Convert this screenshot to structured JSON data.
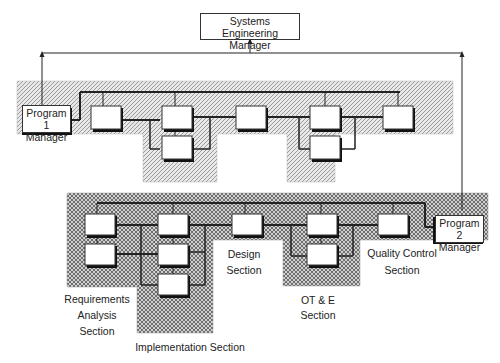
{
  "diagram": {
    "top_manager": {
      "label_line1": "Systems",
      "label_line2": "Engineering Manager"
    },
    "program1": {
      "label_line1": "Program 1",
      "label_line2": "Manager"
    },
    "program2": {
      "label_line1": "Program 2",
      "label_line2": "Manager"
    },
    "sections": [
      {
        "line1": "Requirements",
        "line2": "Analysis",
        "line3": "Section"
      },
      {
        "line1": "Implementation Section"
      },
      {
        "line1": "Design",
        "line2": "Section"
      },
      {
        "line1": "OT & E",
        "line2": "Section"
      },
      {
        "line1": "Quality Control",
        "line2": "Section"
      }
    ],
    "colors": {
      "line": "#222222",
      "hatch_light": "#bdbdbd",
      "hatch_dark": "#555555",
      "box": "#ffffff"
    }
  }
}
